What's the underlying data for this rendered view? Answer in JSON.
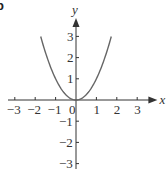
{
  "chart_data": {
    "type": "line",
    "title": "",
    "panel_label": "b",
    "xlabel": "x",
    "ylabel": "y",
    "xlim": [
      -3.5,
      3.5
    ],
    "ylim": [
      -3,
      3.5
    ],
    "x_ticks": [
      -3,
      -2,
      -1,
      0,
      1,
      2,
      3
    ],
    "x_tick_labels": [
      "−3",
      "−2",
      "−1",
      "0",
      "1",
      "2",
      "3"
    ],
    "y_ticks": [
      -3,
      -2,
      -1,
      1,
      2,
      3
    ],
    "y_tick_labels": [
      "−3",
      "−2",
      "−1",
      "1",
      "2",
      "3"
    ],
    "grid": false,
    "series": [
      {
        "name": "y = x²",
        "x": [
          -1.73,
          -1.5,
          -1,
          -0.5,
          0,
          0.5,
          1,
          1.5,
          1.73
        ],
        "y": [
          3,
          2.25,
          1,
          0.25,
          0,
          0.25,
          1,
          2.25,
          3
        ]
      }
    ],
    "colors": {
      "curve": "#666666",
      "axes": "#333333"
    }
  }
}
